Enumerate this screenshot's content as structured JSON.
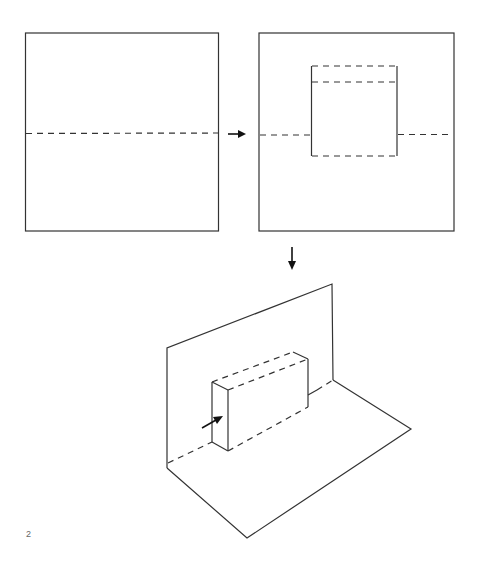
{
  "diagram": {
    "type": "pop-up card folding instructions",
    "step_number": "2",
    "panels": [
      {
        "id": "step-a",
        "description": "Square card with a horizontal dashed fold line across the middle"
      },
      {
        "id": "step-b",
        "description": "Square card with a cut-out rectangle: solid vertical cuts, dashed fold lines at top, upper-inner and bottom, center fold line continues outside"
      },
      {
        "id": "step-c",
        "description": "Card folded to 90 degrees with rectangular pop-up box pushed forward (arrow shows push direction)"
      }
    ],
    "arrows": [
      {
        "id": "arrow-right",
        "from": "step-a",
        "to": "step-b"
      },
      {
        "id": "arrow-down",
        "from": "step-b",
        "to": "step-c"
      },
      {
        "id": "push-arrow",
        "description": "Arrow pushing the pop-up box forward"
      }
    ],
    "colors": {
      "line": "#333333",
      "arrow": "#111111",
      "label": "#666666",
      "background": "#ffffff"
    }
  }
}
